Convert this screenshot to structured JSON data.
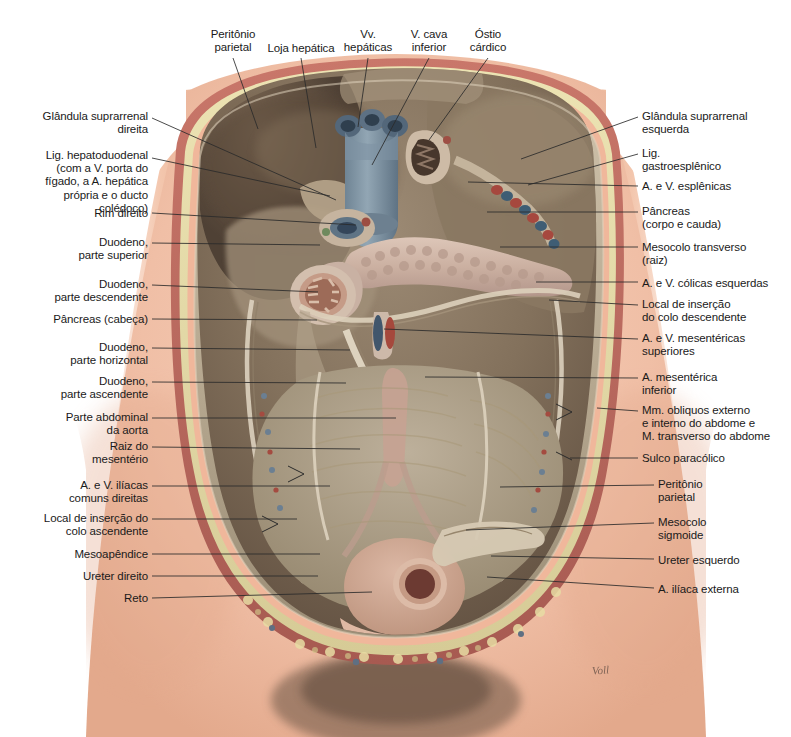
{
  "figure": {
    "artist_signature": "Voll",
    "language": "pt-BR"
  },
  "palette": {
    "skin": "#f2c3ab",
    "skin_shadow": "#e0a98f",
    "muscle_red": "#b9655a",
    "fat_yellow": "#ded6a6",
    "peritoneum": "#b9ad98",
    "cavity_dark": "#6d5a4a",
    "cavity_mid": "#8d7c68",
    "organ_tan": "#c3b49c",
    "pancreas": "#cbb3a6",
    "vein_blue": "#7f93a3",
    "artery_red": "#b4564c",
    "mucosa": "#a9705f",
    "outline": "#2b2b2b",
    "text": "#1a1a1a"
  },
  "labels_top": [
    {
      "id": "peritonio-parietal-sup",
      "text": "Peritônio\nparietal",
      "x": 193,
      "y": 28,
      "w": 80,
      "anchor_x": 233,
      "anchor_y": 58,
      "tip_x": 258,
      "tip_y": 129
    },
    {
      "id": "loja-hepatica",
      "text": "Loja hepática",
      "x": 258,
      "y": 42,
      "w": 86,
      "anchor_x": 301,
      "anchor_y": 58,
      "tip_x": 316,
      "tip_y": 148
    },
    {
      "id": "vv-hepaticas",
      "text": "Vv.\nhepáticas",
      "x": 338,
      "y": 28,
      "w": 60,
      "anchor_x": 368,
      "anchor_y": 58,
      "tip_x": 358,
      "tip_y": 127
    },
    {
      "id": "v-cava-inferior",
      "text": "V. cava\ninferior",
      "x": 398,
      "y": 28,
      "w": 62,
      "anchor_x": 429,
      "anchor_y": 58,
      "tip_x": 372,
      "tip_y": 165
    },
    {
      "id": "ostio-cardico",
      "text": "Óstio\ncárdico",
      "x": 459,
      "y": 28,
      "w": 58,
      "anchor_x": 488,
      "anchor_y": 58,
      "tip_x": 429,
      "tip_y": 140
    }
  ],
  "labels_left": [
    {
      "id": "glandula-suprarrenal-direita",
      "text": "Glândula suprarrenal\ndireita",
      "right": 148,
      "y": 110,
      "anchor_y": 118,
      "tip_x": 336,
      "tip_y": 200
    },
    {
      "id": "lig-hepatoduodenal",
      "text": "Lig. hepatoduodenal\n(com a V. porta do\nfígado, a A. hepática\nprópria e o ducto\ncolédoco)",
      "right": 148,
      "y": 149,
      "anchor_y": 158,
      "tip_x": 330,
      "tip_y": 196
    },
    {
      "id": "rim-direito",
      "text": "Rim direito",
      "right": 148,
      "y": 207,
      "anchor_y": 213,
      "tip_x": 356,
      "tip_y": 225
    },
    {
      "id": "duodeno-parte-superior",
      "text": "Duodeno,\nparte superior",
      "right": 148,
      "y": 236,
      "anchor_y": 243,
      "tip_x": 320,
      "tip_y": 245
    },
    {
      "id": "duodeno-parte-descendente",
      "text": "Duodeno,\nparte descendente",
      "right": 148,
      "y": 278,
      "anchor_y": 285,
      "tip_x": 318,
      "tip_y": 292
    },
    {
      "id": "pancreas-cabeca",
      "text": "Pâncreas (cabeça)",
      "right": 148,
      "y": 313,
      "anchor_y": 319,
      "tip_x": 317,
      "tip_y": 320
    },
    {
      "id": "duodeno-parte-horizontal",
      "text": "Duodeno,\nparte horizontal",
      "right": 148,
      "y": 341,
      "anchor_y": 348,
      "tip_x": 350,
      "tip_y": 350
    },
    {
      "id": "duodeno-parte-ascendente",
      "text": "Duodeno,\nparte ascendente",
      "right": 148,
      "y": 375,
      "anchor_y": 382,
      "tip_x": 346,
      "tip_y": 383
    },
    {
      "id": "parte-abdominal-aorta",
      "text": "Parte abdominal\nda aorta",
      "right": 148,
      "y": 411,
      "anchor_y": 418,
      "tip_x": 396,
      "tip_y": 418
    },
    {
      "id": "raiz-do-mesenterio",
      "text": "Raiz do\nmesentério",
      "right": 148,
      "y": 440,
      "anchor_y": 447,
      "tip_x": 360,
      "tip_y": 449
    },
    {
      "id": "a-v-iliacas-comuns-direitas",
      "text": "A. e V. ilíacas\ncomuns direitas",
      "right": 148,
      "y": 479,
      "anchor_y": 486,
      "tip_x": 330,
      "tip_y": 486
    },
    {
      "id": "local-insercao-colo-ascendente",
      "text": "Local de inserção do\ncolo ascendente",
      "right": 148,
      "y": 512,
      "anchor_y": 519,
      "tip_x": 297,
      "tip_y": 519
    },
    {
      "id": "mesoapendice",
      "text": "Mesoapêndice",
      "right": 148,
      "y": 548,
      "anchor_y": 554,
      "tip_x": 320,
      "tip_y": 554
    },
    {
      "id": "ureter-direito",
      "text": "Ureter direito",
      "right": 148,
      "y": 570,
      "anchor_y": 576,
      "tip_x": 318,
      "tip_y": 576
    },
    {
      "id": "reto",
      "text": "Reto",
      "right": 148,
      "y": 592,
      "anchor_y": 598,
      "tip_x": 372,
      "tip_y": 592
    }
  ],
  "labels_right": [
    {
      "id": "glandula-suprarrenal-esquerda",
      "text": "Glândula suprarrenal\nesquerda",
      "left": 642,
      "y": 110,
      "anchor_y": 117,
      "tip_x": 521,
      "tip_y": 159
    },
    {
      "id": "lig-gastroesplenico",
      "text": "Lig.\ngastroesplênico",
      "left": 642,
      "y": 147,
      "anchor_y": 154,
      "tip_x": 528,
      "tip_y": 185
    },
    {
      "id": "a-v-esplenicas",
      "text": "A. e V. esplênicas",
      "left": 642,
      "y": 180,
      "anchor_y": 186,
      "tip_x": 468,
      "tip_y": 182
    },
    {
      "id": "pancreas-corpo-cauda",
      "text": "Pâncreas\n(corpo e cauda)",
      "left": 642,
      "y": 205,
      "anchor_y": 212,
      "tip_x": 487,
      "tip_y": 212
    },
    {
      "id": "mesocolo-transverso-raiz",
      "text": "Mesocolo transverso\n(raiz)",
      "left": 642,
      "y": 241,
      "anchor_y": 247,
      "tip_x": 500,
      "tip_y": 247
    },
    {
      "id": "a-v-colicas-esquerdas",
      "text": "A. e V. cólicas esquerdas",
      "left": 642,
      "y": 277,
      "anchor_y": 282,
      "tip_x": 536,
      "tip_y": 282
    },
    {
      "id": "local-insercao-colo-descendente",
      "text": "Local de inserção\ndo colo descendente",
      "left": 642,
      "y": 298,
      "anchor_y": 305,
      "tip_x": 549,
      "tip_y": 300
    },
    {
      "id": "a-v-mesentericas-superiores",
      "text": "A. e V. mesentéricas\nsuperiores",
      "left": 642,
      "y": 332,
      "anchor_y": 339,
      "tip_x": 384,
      "tip_y": 329
    },
    {
      "id": "a-mesenterica-inferior",
      "text": "A. mesentérica\ninferior",
      "left": 642,
      "y": 371,
      "anchor_y": 378,
      "tip_x": 425,
      "tip_y": 377
    },
    {
      "id": "mm-obliquos-transverso",
      "text": "Mm. obliquos externo\ne interno do abdome e\nM. transverso do abdome",
      "left": 642,
      "y": 404,
      "anchor_y": 411,
      "tip_x": 597,
      "tip_y": 408
    },
    {
      "id": "sulco-paracolico",
      "text": "Sulco paracólico",
      "left": 642,
      "y": 452,
      "anchor_y": 458,
      "tip_x": 570,
      "tip_y": 458
    },
    {
      "id": "peritonio-parietal-inf",
      "text": "Peritônio\nparietal",
      "left": 658,
      "y": 478,
      "anchor_y": 485,
      "tip_x": 500,
      "tip_y": 487
    },
    {
      "id": "mesocolo-sigmoide",
      "text": "Mesocolo\nsigmoide",
      "left": 658,
      "y": 516,
      "anchor_y": 523,
      "tip_x": 466,
      "tip_y": 530
    },
    {
      "id": "ureter-esquerdo",
      "text": "Ureter esquerdo",
      "left": 658,
      "y": 554,
      "anchor_y": 559,
      "tip_x": 491,
      "tip_y": 556
    },
    {
      "id": "a-iliaca-externa",
      "text": "A. ilíaca externa",
      "left": 658,
      "y": 583,
      "anchor_y": 588,
      "tip_x": 487,
      "tip_y": 577
    }
  ]
}
